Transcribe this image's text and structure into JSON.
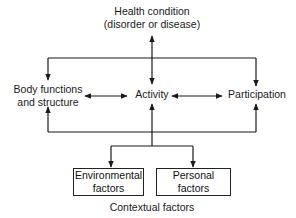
{
  "diagram": {
    "nodes": {
      "health_condition": {
        "line1": "Health condition",
        "line2": "(disorder or disease)"
      },
      "body_functions": {
        "line1": "Body functions",
        "line2": "and structure"
      },
      "activity": {
        "label": "Activity"
      },
      "participation": {
        "label": "Participation"
      },
      "environmental": {
        "line1": "Environmental",
        "line2": "factors"
      },
      "personal": {
        "line1": "Personal",
        "line2": "factors"
      }
    },
    "group_label": "Contextual factors",
    "edges": [
      {
        "from": "health_condition",
        "to": "activity",
        "type": "bidirectional"
      },
      {
        "from": "health_condition",
        "to": "body_functions",
        "type": "directed"
      },
      {
        "from": "health_condition",
        "to": "participation",
        "type": "directed"
      },
      {
        "from": "body_functions",
        "to": "activity",
        "type": "bidirectional"
      },
      {
        "from": "activity",
        "to": "participation",
        "type": "bidirectional"
      },
      {
        "from": "contextual_factors",
        "to": "body_functions",
        "type": "directed"
      },
      {
        "from": "contextual_factors",
        "to": "activity",
        "type": "directed"
      },
      {
        "from": "contextual_factors",
        "to": "participation",
        "type": "directed"
      },
      {
        "from": "activity",
        "to": "environmental",
        "type": "directed"
      },
      {
        "from": "activity",
        "to": "personal",
        "type": "directed"
      }
    ],
    "colors": {
      "line": "#1a1a1a",
      "background": "#ffffff"
    }
  }
}
